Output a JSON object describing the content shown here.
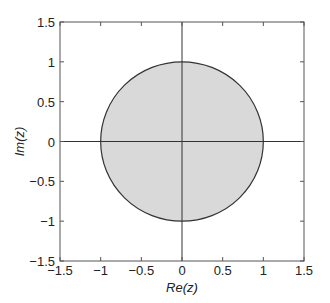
{
  "chart_data": {
    "type": "scatter",
    "title": "",
    "xlabel": "Re(z)",
    "ylabel": "Im(z)",
    "xlim": [
      -1.5,
      1.5
    ],
    "ylim": [
      -1.5,
      1.5
    ],
    "xticks": [
      -1.5,
      -1,
      -0.5,
      0,
      0.5,
      1,
      1.5
    ],
    "yticks": [
      -1.5,
      -1,
      -0.5,
      0,
      0.5,
      1,
      1.5
    ],
    "xtick_labels": [
      "−1.5",
      "−1",
      "−0.5",
      "0",
      "0.5",
      "1",
      "1.5"
    ],
    "ytick_labels": [
      "−1.5",
      "−1",
      "−0.5",
      "0",
      "0.5",
      "1",
      "1.5"
    ],
    "grid": false,
    "legend": null,
    "shapes": [
      {
        "kind": "circle",
        "center": [
          0,
          0
        ],
        "radius": 1,
        "fill": "#d9d9d9",
        "stroke": "#333333"
      },
      {
        "kind": "line",
        "from": [
          -1.5,
          0
        ],
        "to": [
          1.5,
          0
        ],
        "stroke": "#333333"
      },
      {
        "kind": "line",
        "from": [
          0,
          -1.5
        ],
        "to": [
          0,
          1.5
        ],
        "stroke": "#333333"
      }
    ]
  },
  "colors": {
    "disk_fill": "#d9d9d9",
    "stroke": "#333333",
    "frame": "#555555"
  }
}
